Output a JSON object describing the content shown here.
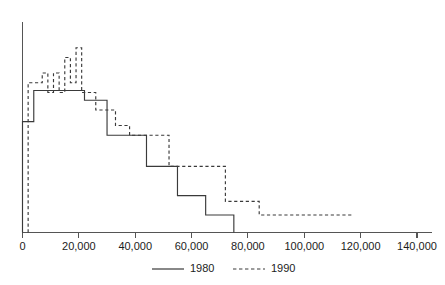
{
  "chart_data": {
    "type": "line",
    "title": "",
    "xlabel": "",
    "ylabel": "",
    "grid": false,
    "legend_position": "bottom",
    "xlim": [
      0,
      140000
    ],
    "xticks": [
      0,
      20000,
      40000,
      60000,
      80000,
      100000,
      120000,
      140000
    ],
    "xtick_labels": [
      "0",
      "20,000",
      "40,000",
      "60,000",
      "80,000",
      "100,000",
      "120,000",
      "140,000"
    ],
    "ylim": [
      0,
      100
    ],
    "yticks": [],
    "ytick_labels": [],
    "series": [
      {
        "name": "1980",
        "style": "solid",
        "color": "#3a3a3a",
        "step_edges": [
          0,
          4000,
          9000,
          13000,
          18000,
          22000,
          26000,
          30000,
          36000,
          44000,
          55000,
          65000,
          75000
        ],
        "step_values": [
          57,
          73,
          73,
          73,
          73,
          68,
          68,
          50,
          50,
          34,
          19,
          9,
          0
        ]
      },
      {
        "name": "1990",
        "style": "dashed",
        "color": "#3a3a3a",
        "step_edges": [
          2000,
          5000,
          7000,
          9000,
          11000,
          13000,
          15000,
          17000,
          19000,
          21000,
          23000,
          26000,
          29000,
          33000,
          38000,
          44000,
          52000,
          62000,
          72000,
          84000,
          117000
        ],
        "step_values": [
          77,
          77,
          82,
          72,
          82,
          72,
          90,
          77,
          95,
          72,
          72,
          63,
          63,
          55,
          50,
          50,
          34,
          34,
          16,
          9,
          9
        ]
      }
    ]
  },
  "legend": {
    "items": [
      {
        "label": "1980",
        "style": "solid"
      },
      {
        "label": "1990",
        "style": "dashed"
      }
    ]
  },
  "axis": {
    "x_axis_name": "x-axis",
    "y_axis_name": "y-axis"
  }
}
